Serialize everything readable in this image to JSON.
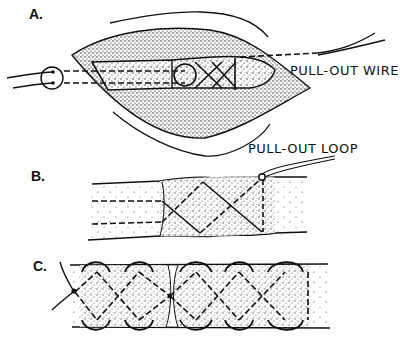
{
  "figure": {
    "panels": [
      {
        "id": "A",
        "label": "A.",
        "annotation": "PULL-OUT WIRE",
        "description": "Open wound exposing tendon with crisscross suture and pull-out wire exiting through skin button"
      },
      {
        "id": "B",
        "label": "B.",
        "annotation": "PULL-OUT LOOP",
        "description": "Tendon segment with crisscross (Bunnell) suture and pull-out loop"
      },
      {
        "id": "C",
        "label": "C.",
        "annotation": "",
        "description": "End-to-end tendon repair with crisscross sutures across the juncture"
      }
    ],
    "colors": {
      "ink": "#111111",
      "background": "#ffffff"
    }
  }
}
